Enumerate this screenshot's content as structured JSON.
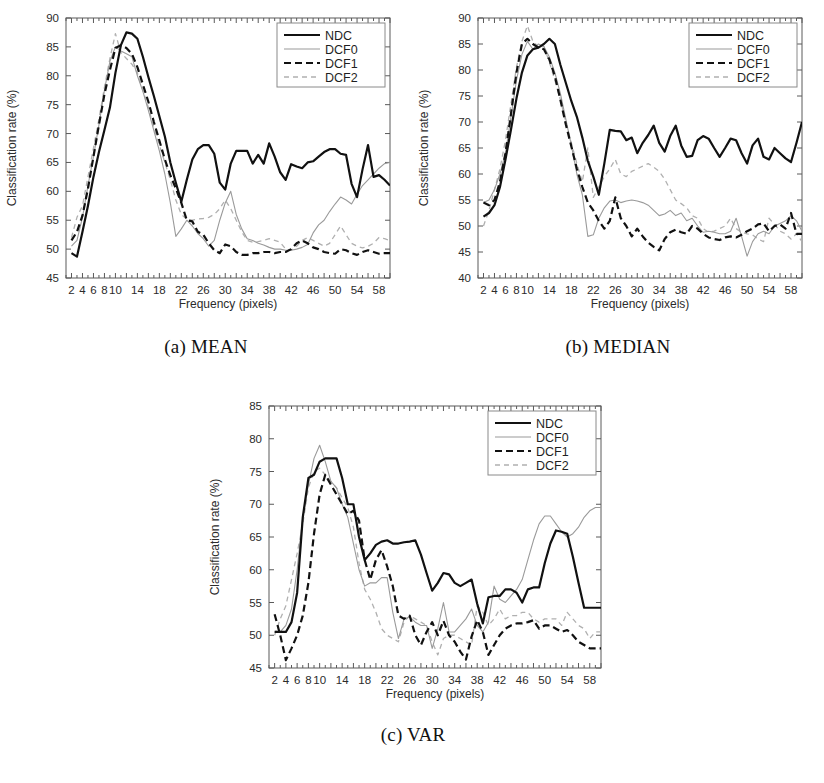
{
  "figure": {
    "title_hidden": "",
    "panels": [
      "a",
      "b",
      "c"
    ]
  },
  "common": {
    "xlabel": "Frequency (pixels)",
    "ylabel": "Classification rate (%)",
    "x_tick_labels": [
      "2",
      "4",
      "6",
      "8",
      "10",
      "14",
      "18",
      "22",
      "26",
      "30",
      "34",
      "38",
      "42",
      "46",
      "50",
      "54",
      "58"
    ],
    "x_tick_values": [
      2,
      4,
      6,
      8,
      10,
      14,
      18,
      22,
      26,
      30,
      34,
      38,
      42,
      46,
      50,
      54,
      58
    ],
    "legend_entries": [
      {
        "name": "NDC",
        "style": "solid",
        "color": "#111111",
        "width": 2.2
      },
      {
        "name": "DCF0",
        "style": "solid",
        "color": "#9a9a9a",
        "width": 1.1
      },
      {
        "name": "DCF1",
        "style": "dashed",
        "color": "#111111",
        "width": 2.2
      },
      {
        "name": "DCF2",
        "style": "dashed",
        "color": "#b0b0b0",
        "width": 1.3
      }
    ]
  },
  "chart_data": [
    {
      "id": "a",
      "type": "line",
      "caption": "(a) MEAN",
      "title": "",
      "xlabel": "Frequency (pixels)",
      "ylabel": "Classification rate (%)",
      "xlim": [
        1,
        60
      ],
      "ylim": [
        45,
        90
      ],
      "y_ticks": [
        45,
        50,
        55,
        60,
        65,
        70,
        75,
        80,
        85,
        90
      ],
      "x": [
        2,
        3,
        4,
        5,
        6,
        7,
        8,
        9,
        10,
        11,
        12,
        13,
        14,
        15,
        16,
        17,
        18,
        19,
        20,
        21,
        22,
        23,
        24,
        25,
        26,
        27,
        28,
        29,
        30,
        31,
        32,
        33,
        34,
        35,
        36,
        37,
        38,
        39,
        40,
        41,
        42,
        43,
        44,
        45,
        46,
        47,
        48,
        49,
        50,
        51,
        52,
        53,
        54,
        55,
        56,
        57,
        58,
        59,
        60
      ],
      "grid": false,
      "legend_position": "top-right",
      "series": [
        {
          "name": "NDC",
          "values": [
            49.3,
            48.7,
            53.0,
            57.5,
            62.5,
            66.8,
            70.6,
            74.5,
            80.5,
            85.3,
            87.5,
            87.3,
            86.4,
            83.3,
            79.8,
            76.5,
            73.0,
            69.5,
            65.0,
            61.5,
            58.2,
            62.0,
            65.5,
            67.3,
            68.0,
            68.0,
            66.5,
            61.5,
            60.3,
            64.8,
            67.0,
            67.0,
            67.0,
            64.8,
            66.3,
            64.8,
            68.3,
            66.0,
            63.3,
            62.0,
            64.7,
            64.3,
            64.0,
            65.0,
            65.2,
            66.0,
            66.8,
            67.3,
            67.3,
            66.5,
            66.3,
            61.3,
            59.0,
            63.8,
            68.0,
            62.5,
            62.8,
            62.0,
            61.0
          ]
        },
        {
          "name": "DCF0",
          "values": [
            50.5,
            51.5,
            55.5,
            61.0,
            66.0,
            71.5,
            77.5,
            82.5,
            85.0,
            84.3,
            83.8,
            83.3,
            80.0,
            77.3,
            74.0,
            70.5,
            67.0,
            63.0,
            58.0,
            52.2,
            53.5,
            55.0,
            54.0,
            52.7,
            51.8,
            50.5,
            51.5,
            55.0,
            58.0,
            60.0,
            56.0,
            53.5,
            51.8,
            51.5,
            51.0,
            50.7,
            50.3,
            50.0,
            50.0,
            49.8,
            49.8,
            50.0,
            50.3,
            50.8,
            52.8,
            54.2,
            55.0,
            56.5,
            57.8,
            59.0,
            58.5,
            57.8,
            59.5,
            61.0,
            62.0,
            63.0,
            64.0,
            64.8,
            65.0
          ]
        },
        {
          "name": "DCF1",
          "values": [
            51.5,
            53.0,
            55.8,
            60.5,
            66.0,
            71.5,
            76.8,
            81.0,
            84.8,
            85.3,
            84.8,
            83.8,
            81.5,
            78.5,
            75.5,
            72.0,
            68.8,
            65.5,
            62.8,
            60.5,
            58.0,
            55.0,
            54.8,
            53.0,
            52.5,
            51.0,
            49.8,
            49.3,
            50.8,
            50.5,
            49.5,
            49.0,
            49.0,
            49.3,
            49.3,
            49.5,
            49.5,
            49.3,
            49.5,
            49.5,
            50.0,
            51.0,
            51.5,
            51.0,
            50.3,
            50.0,
            49.5,
            49.3,
            49.2,
            50.0,
            49.8,
            49.3,
            49.0,
            49.5,
            49.8,
            49.5,
            49.2,
            49.3,
            49.3
          ]
        },
        {
          "name": "DCF2",
          "values": [
            52.0,
            55.5,
            57.5,
            62.5,
            67.5,
            72.5,
            78.0,
            83.0,
            87.3,
            84.0,
            83.0,
            82.0,
            80.5,
            77.5,
            74.5,
            71.0,
            68.0,
            65.0,
            62.0,
            58.5,
            56.0,
            55.2,
            55.0,
            55.2,
            55.3,
            55.5,
            56.0,
            57.0,
            58.5,
            57.0,
            55.0,
            53.0,
            51.5,
            51.2,
            51.3,
            51.5,
            51.8,
            51.5,
            51.2,
            50.0,
            49.8,
            50.5,
            51.5,
            52.0,
            51.5,
            51.0,
            50.5,
            51.0,
            52.5,
            54.0,
            52.5,
            51.0,
            50.5,
            50.2,
            50.5,
            51.0,
            52.0,
            51.8,
            51.5
          ]
        }
      ]
    },
    {
      "id": "b",
      "type": "line",
      "caption": "(b) MEDIAN",
      "title": "",
      "xlabel": "Frequency (pixels)",
      "ylabel": "Classification rate (%)",
      "xlim": [
        1,
        60
      ],
      "ylim": [
        40,
        90
      ],
      "y_ticks": [
        40,
        45,
        50,
        55,
        60,
        65,
        70,
        75,
        80,
        85,
        90
      ],
      "x": [
        2,
        3,
        4,
        5,
        6,
        7,
        8,
        9,
        10,
        11,
        12,
        13,
        14,
        15,
        16,
        17,
        18,
        19,
        20,
        21,
        22,
        23,
        24,
        25,
        26,
        27,
        28,
        29,
        30,
        31,
        32,
        33,
        34,
        35,
        36,
        37,
        38,
        39,
        40,
        41,
        42,
        43,
        44,
        45,
        46,
        47,
        48,
        49,
        50,
        51,
        52,
        53,
        54,
        55,
        56,
        57,
        58,
        59,
        60
      ],
      "grid": false,
      "legend_position": "top-right",
      "series": [
        {
          "name": "NDC",
          "values": [
            51.8,
            52.5,
            54.0,
            57.5,
            62.8,
            68.5,
            74.5,
            79.5,
            82.8,
            84.0,
            84.3,
            85.0,
            86.0,
            85.0,
            81.0,
            77.5,
            74.0,
            71.0,
            67.0,
            62.5,
            59.5,
            56.0,
            62.0,
            68.5,
            68.3,
            68.2,
            66.5,
            67.0,
            64.0,
            66.0,
            67.5,
            69.3,
            66.0,
            64.3,
            67.3,
            69.3,
            65.5,
            63.3,
            63.5,
            66.5,
            67.3,
            66.8,
            65.0,
            63.3,
            65.0,
            66.8,
            66.5,
            64.0,
            62.0,
            65.5,
            66.8,
            63.3,
            62.8,
            65.0,
            64.0,
            63.0,
            62.3,
            66.0,
            70.0
          ]
        },
        {
          "name": "DCF0",
          "values": [
            54.5,
            55.0,
            57.0,
            60.0,
            64.0,
            71.0,
            78.0,
            83.0,
            85.5,
            84.0,
            85.0,
            84.5,
            82.5,
            79.5,
            75.5,
            70.5,
            65.5,
            60.0,
            56.0,
            48.0,
            48.3,
            51.5,
            53.5,
            54.8,
            55.0,
            54.5,
            54.8,
            55.0,
            54.8,
            54.5,
            54.0,
            53.0,
            52.0,
            52.3,
            53.0,
            52.0,
            52.5,
            51.0,
            51.5,
            50.0,
            48.8,
            49.0,
            48.8,
            48.5,
            48.5,
            49.0,
            51.5,
            48.0,
            44.2,
            47.0,
            48.5,
            49.0,
            48.5,
            50.0,
            50.5,
            51.0,
            52.0,
            51.0,
            49.0
          ]
        },
        {
          "name": "DCF1",
          "values": [
            54.5,
            54.0,
            55.0,
            58.5,
            64.0,
            71.5,
            79.5,
            85.0,
            86.0,
            85.0,
            84.3,
            84.0,
            82.0,
            78.8,
            74.3,
            69.5,
            65.3,
            61.0,
            57.5,
            54.5,
            53.0,
            51.0,
            49.5,
            51.0,
            55.5,
            51.5,
            50.0,
            48.0,
            49.5,
            48.0,
            46.8,
            46.0,
            45.3,
            47.5,
            48.8,
            49.3,
            48.8,
            48.5,
            50.0,
            49.5,
            48.5,
            47.8,
            47.5,
            47.3,
            47.8,
            48.0,
            47.8,
            48.3,
            49.0,
            49.5,
            50.3,
            50.5,
            49.0,
            50.0,
            50.3,
            49.5,
            52.5,
            48.5,
            48.5
          ]
        },
        {
          "name": "DCF2",
          "values": [
            50.0,
            53.0,
            57.0,
            61.0,
            66.5,
            73.5,
            80.5,
            85.5,
            88.5,
            85.5,
            84.5,
            84.5,
            81.5,
            78.0,
            74.3,
            70.0,
            66.0,
            62.0,
            58.5,
            65.0,
            55.5,
            57.5,
            59.5,
            61.0,
            62.8,
            60.0,
            59.5,
            60.5,
            61.0,
            61.5,
            62.0,
            61.3,
            60.5,
            59.0,
            57.0,
            55.0,
            54.3,
            53.5,
            52.0,
            51.5,
            49.5,
            48.8,
            49.0,
            49.5,
            50.0,
            51.5,
            49.5,
            48.8,
            48.5,
            48.3,
            47.5,
            47.0,
            51.5,
            50.3,
            49.0,
            48.5,
            47.5,
            48.5,
            47.0
          ]
        }
      ]
    },
    {
      "id": "c",
      "type": "line",
      "caption": "(c) VAR",
      "title": "",
      "xlabel": "Frequency (pixels)",
      "ylabel": "Classification rate (%)",
      "xlim": [
        1,
        60
      ],
      "ylim": [
        45,
        85
      ],
      "y_ticks": [
        45,
        50,
        55,
        60,
        65,
        70,
        75,
        80,
        85
      ],
      "x": [
        2,
        3,
        4,
        5,
        6,
        7,
        8,
        9,
        10,
        11,
        12,
        13,
        14,
        15,
        16,
        17,
        18,
        19,
        20,
        21,
        22,
        23,
        24,
        25,
        26,
        27,
        28,
        29,
        30,
        31,
        32,
        33,
        34,
        35,
        36,
        37,
        38,
        39,
        40,
        41,
        42,
        43,
        44,
        45,
        46,
        47,
        48,
        49,
        50,
        51,
        52,
        53,
        54,
        55,
        56,
        57,
        58,
        59,
        60
      ],
      "grid": false,
      "legend_position": "top-right",
      "series": [
        {
          "name": "NDC",
          "values": [
            50.5,
            50.5,
            50.5,
            52.0,
            56.5,
            68.0,
            74.0,
            74.5,
            76.5,
            77.0,
            77.0,
            77.0,
            74.0,
            70.0,
            70.0,
            65.0,
            61.5,
            62.5,
            63.8,
            64.3,
            64.5,
            64.0,
            64.0,
            64.2,
            64.3,
            64.5,
            62.3,
            59.5,
            56.8,
            58.0,
            59.5,
            59.3,
            58.0,
            57.5,
            58.0,
            58.5,
            54.8,
            51.8,
            55.8,
            56.0,
            56.0,
            57.0,
            57.0,
            56.5,
            55.0,
            57.0,
            57.3,
            57.3,
            61.0,
            64.0,
            66.0,
            65.8,
            65.5,
            62.0,
            58.0,
            54.2,
            54.2,
            54.2,
            54.2
          ]
        },
        {
          "name": "DCF0",
          "values": [
            50.5,
            50.5,
            51.5,
            54.0,
            60.0,
            68.0,
            73.0,
            77.0,
            79.0,
            76.5,
            73.5,
            72.5,
            70.0,
            68.0,
            64.0,
            60.0,
            57.5,
            58.0,
            58.0,
            58.8,
            58.8,
            53.5,
            49.5,
            52.5,
            52.8,
            52.0,
            51.5,
            51.5,
            48.0,
            51.0,
            55.0,
            50.5,
            50.5,
            51.5,
            52.5,
            54.0,
            51.5,
            50.5,
            52.0,
            57.5,
            55.5,
            55.0,
            56.0,
            57.0,
            58.5,
            61.5,
            64.5,
            67.0,
            68.2,
            68.2,
            67.0,
            65.8,
            65.0,
            65.5,
            66.5,
            68.0,
            69.0,
            69.5,
            69.5
          ]
        },
        {
          "name": "DCF1",
          "values": [
            53.2,
            50.0,
            46.2,
            48.0,
            50.0,
            53.0,
            58.0,
            65.5,
            71.5,
            74.5,
            73.0,
            71.5,
            70.0,
            68.5,
            69.0,
            67.5,
            61.5,
            58.5,
            61.5,
            63.0,
            60.5,
            57.5,
            53.0,
            52.5,
            53.0,
            50.0,
            48.5,
            50.5,
            52.0,
            50.0,
            52.2,
            50.0,
            49.0,
            47.5,
            46.3,
            49.8,
            52.3,
            50.5,
            47.0,
            48.5,
            50.0,
            51.0,
            51.5,
            51.8,
            51.8,
            52.0,
            52.3,
            51.0,
            51.5,
            51.5,
            51.0,
            50.5,
            50.8,
            50.0,
            49.0,
            48.5,
            48.0,
            48.0,
            48.0
          ]
        },
        {
          "name": "DCF2",
          "values": [
            50.0,
            52.5,
            54.5,
            58.5,
            62.5,
            67.0,
            72.5,
            75.0,
            75.5,
            74.5,
            73.5,
            72.5,
            71.0,
            69.5,
            66.5,
            61.0,
            57.0,
            55.5,
            53.5,
            51.0,
            50.0,
            49.5,
            49.0,
            52.0,
            53.0,
            52.5,
            52.0,
            51.5,
            49.0,
            47.0,
            49.5,
            50.0,
            50.0,
            49.5,
            49.0,
            48.5,
            54.5,
            53.5,
            51.5,
            52.5,
            54.0,
            52.5,
            53.0,
            53.0,
            53.5,
            53.5,
            52.5,
            52.0,
            52.5,
            52.5,
            52.5,
            51.5,
            53.5,
            52.5,
            51.5,
            51.0,
            49.5,
            50.5,
            50.5
          ]
        }
      ]
    }
  ]
}
